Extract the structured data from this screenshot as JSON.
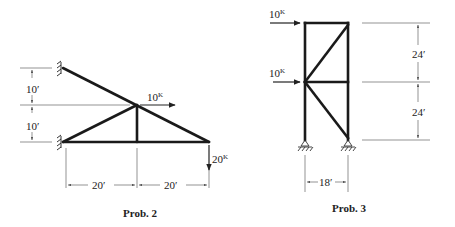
{
  "prob2": {
    "caption": "Prob. 2",
    "dims": {
      "v_top": "10′",
      "v_bottom": "10′",
      "h_left": "20′",
      "h_right": "20′"
    },
    "loads": {
      "horizontal": {
        "value": "10",
        "unit": "K"
      },
      "vertical": {
        "value": "20",
        "unit": "K"
      }
    }
  },
  "prob3": {
    "caption": "Prob. 3",
    "dims": {
      "v_top": "24′",
      "v_bottom": "24′",
      "width": "18′"
    },
    "loads": {
      "top": {
        "value": "10",
        "unit": "K"
      },
      "mid": {
        "value": "10",
        "unit": "K"
      }
    }
  },
  "colors": {
    "ink": "#1a1a1a",
    "dim": "#555555"
  }
}
